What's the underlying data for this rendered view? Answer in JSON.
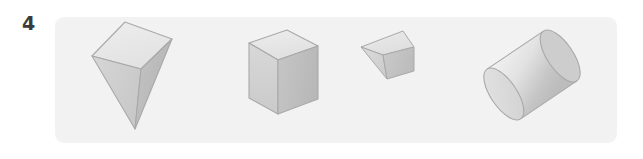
{
  "question": {
    "number": "4",
    "number_name": "question-number-4"
  },
  "panel": {
    "background_color": "#f2f2f2",
    "corner_radius_px": 9
  },
  "page_background_color": "#ffffff",
  "figure_set": {
    "description": "Row of four shaded grey 3D solids on a light grey panel",
    "count": 4,
    "shapes": [
      {
        "index": 1,
        "name": "square-pyramid",
        "label": "square pyramid",
        "orientation": "inverted, apex pointing down",
        "faces_visible": [
          "top square face",
          "front-left triangular face",
          "front-right triangular face"
        ],
        "colors": {
          "top": "#e8e8e8",
          "left": "#d0d0d0",
          "right": "#bdbdbd",
          "outline": "#a8a8a8"
        }
      },
      {
        "index": 2,
        "name": "cube",
        "label": "cube",
        "orientation": "three-quarter view, top face visible",
        "faces_visible": [
          "top face",
          "front face",
          "right face"
        ],
        "colors": {
          "top": "#e6e6e6",
          "left": "#d2d2d2",
          "right": "#bfbfbf",
          "outline": "#a8a8a8"
        }
      },
      {
        "index": 3,
        "name": "triangular-prism",
        "label": "small triangular prism",
        "orientation": "tilted, small scale",
        "faces_visible": [
          "top face",
          "front-left face",
          "right end face"
        ],
        "colors": {
          "top": "#e4e4e4",
          "left": "#d4d4d4",
          "right": "#c2c2c2",
          "outline": "#a8a8a8"
        }
      },
      {
        "index": 4,
        "name": "cylinder",
        "label": "cylinder",
        "orientation": "tilted diagonally, near circular face at lower left",
        "faces_visible": [
          "near circular face",
          "curved lateral surface",
          "far circular edge"
        ],
        "colors": {
          "near_face": "#dadada",
          "body_light": "#f0f0f0",
          "body_dark": "#c4c4c4",
          "outline": "#a8a8a8"
        }
      }
    ]
  }
}
